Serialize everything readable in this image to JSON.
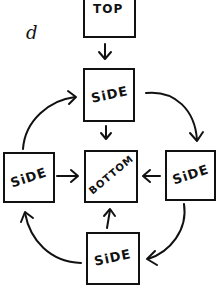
{
  "panel_label": "d",
  "nodes": {
    "top": {
      "label": "TOP"
    },
    "side_top": {
      "label": "SiDE"
    },
    "side_left": {
      "label": "SiDE"
    },
    "bottom": {
      "label": "BOTTOM"
    },
    "side_right": {
      "label": "SiDE"
    },
    "side_bottom": {
      "label": "SiDE"
    }
  },
  "edges": [
    {
      "from": "top",
      "to": "side_top",
      "type": "straight"
    },
    {
      "from": "side_top",
      "to": "bottom",
      "type": "straight"
    },
    {
      "from": "side_left",
      "to": "bottom",
      "type": "straight"
    },
    {
      "from": "side_right",
      "to": "bottom",
      "type": "straight"
    },
    {
      "from": "side_bottom",
      "to": "bottom",
      "type": "straight"
    },
    {
      "from": "side_top",
      "to": "side_right",
      "type": "curved"
    },
    {
      "from": "side_right",
      "to": "side_bottom",
      "type": "curved"
    },
    {
      "from": "side_bottom",
      "to": "side_left",
      "type": "curved"
    },
    {
      "from": "side_left",
      "to": "side_top",
      "type": "curved"
    }
  ],
  "colors": {
    "ink": "#111111",
    "background": "#ffffff"
  }
}
